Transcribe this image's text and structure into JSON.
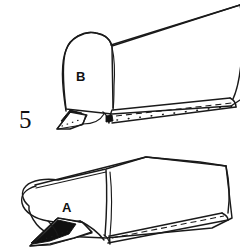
{
  "illustration": {
    "title": "Sewing instruction line drawing",
    "figure_number": "5",
    "background_color": "#ffffff",
    "ink_color": "#1a1a1a",
    "shade_color": "#101010",
    "width": 240,
    "height": 248
  },
  "labels": {
    "figure_number": "5",
    "part_b": "B",
    "part_a": "A"
  },
  "views": [
    {
      "id": "upper-view",
      "part_label": "B",
      "description": "Upright rounded-end fabric form with hem stitching along lower edge and folded dark corner at left"
    },
    {
      "id": "lower-view",
      "part_label": "A",
      "description": "Flattened rounded-end fabric form with hem stitching along lower edge and folded dark corner at left"
    }
  ],
  "stitching": {
    "dashed_line_label": "seam stitch line",
    "dotted_line_label": "topstitch dots"
  }
}
